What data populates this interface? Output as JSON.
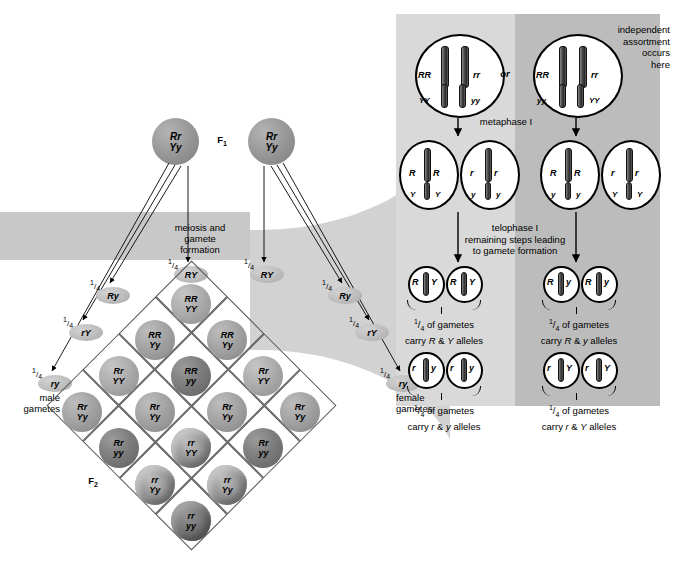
{
  "figure": {
    "generation_f1": "F<sub>1</sub>",
    "generation_f2": "F<sub>2</sub>"
  },
  "labels": {
    "f1": "F1",
    "f1_sub": "1",
    "f2": "F2",
    "f2_sub": "2",
    "meiosis_line1": "meiosis and",
    "meiosis_line2": "gamete",
    "meiosis_line3": "formation",
    "male_gametes_line1": "male",
    "male_gametes_line2": "gametes",
    "female_gametes_line1": "female",
    "female_gametes_line2": "gametes",
    "or": "or",
    "independent_1": "independent",
    "independent_2": "assortment",
    "independent_3": "occurs",
    "independent_4": "here",
    "metaphase": "metaphase I",
    "telophase_1": "telophase I",
    "telophase_2": "remaining steps leading",
    "telophase_3": "to gamete formation",
    "fraction_numerator": "1",
    "fraction_denominator": "4"
  },
  "parents": [
    {
      "id": "f1-parent-left",
      "genotype_top": "Rr",
      "genotype_bottom": "Yy"
    },
    {
      "id": "f1-parent-right",
      "genotype_top": "Rr",
      "genotype_bottom": "Yy"
    }
  ],
  "male_gametes": [
    {
      "label": "RY",
      "fraction": "1/4"
    },
    {
      "label": "Ry",
      "fraction": "1/4"
    },
    {
      "label": "rY",
      "fraction": "1/4"
    },
    {
      "label": "ry",
      "fraction": "1/4"
    }
  ],
  "female_gametes": [
    {
      "label": "RY",
      "fraction": "1/4"
    },
    {
      "label": "Ry",
      "fraction": "1/4"
    },
    {
      "label": "rY",
      "fraction": "1/4"
    },
    {
      "label": "ry",
      "fraction": "1/4"
    }
  ],
  "punnett": {
    "rows": 4,
    "cols": 4,
    "male_axis": [
      "RY",
      "Ry",
      "rY",
      "ry"
    ],
    "female_axis": [
      "RY",
      "Ry",
      "rY",
      "ry"
    ],
    "cells": [
      {
        "r": 0,
        "c": 0,
        "top": "RR",
        "bottom": "YY",
        "phenotype": "round-yellow",
        "shade": "mid"
      },
      {
        "r": 0,
        "c": 1,
        "top": "RR",
        "bottom": "Yy",
        "phenotype": "round-yellow",
        "shade": "mid"
      },
      {
        "r": 0,
        "c": 2,
        "top": "Rr",
        "bottom": "YY",
        "phenotype": "round-yellow",
        "shade": "mid"
      },
      {
        "r": 0,
        "c": 3,
        "top": "Rr",
        "bottom": "Yy",
        "phenotype": "round-yellow",
        "shade": "mid"
      },
      {
        "r": 1,
        "c": 0,
        "top": "RR",
        "bottom": "Yy",
        "phenotype": "round-yellow",
        "shade": "mid"
      },
      {
        "r": 1,
        "c": 1,
        "top": "RR",
        "bottom": "yy",
        "phenotype": "round-green",
        "shade": "dark"
      },
      {
        "r": 1,
        "c": 2,
        "top": "Rr",
        "bottom": "Yy",
        "phenotype": "round-yellow",
        "shade": "mid"
      },
      {
        "r": 1,
        "c": 3,
        "top": "Rr",
        "bottom": "yy",
        "phenotype": "round-green",
        "shade": "dark"
      },
      {
        "r": 2,
        "c": 0,
        "top": "Rr",
        "bottom": "YY",
        "phenotype": "round-yellow",
        "shade": "mid"
      },
      {
        "r": 2,
        "c": 1,
        "top": "Rr",
        "bottom": "Yy",
        "phenotype": "round-yellow",
        "shade": "mid"
      },
      {
        "r": 2,
        "c": 2,
        "top": "rr",
        "bottom": "YY",
        "phenotype": "wrinkled-yellow",
        "shade": "wrinkled"
      },
      {
        "r": 2,
        "c": 3,
        "top": "rr",
        "bottom": "Yy",
        "phenotype": "wrinkled-yellow",
        "shade": "wrinkled"
      },
      {
        "r": 3,
        "c": 0,
        "top": "Rr",
        "bottom": "Yy",
        "phenotype": "round-yellow",
        "shade": "mid"
      },
      {
        "r": 3,
        "c": 1,
        "top": "Rr",
        "bottom": "yy",
        "phenotype": "round-green",
        "shade": "dark"
      },
      {
        "r": 3,
        "c": 2,
        "top": "rr",
        "bottom": "Yy",
        "phenotype": "wrinkled-yellow",
        "shade": "wrinkled"
      },
      {
        "r": 3,
        "c": 3,
        "top": "rr",
        "bottom": "yy",
        "phenotype": "wrinkled-green",
        "shade": "wrinkled-dark"
      }
    ]
  },
  "meiosis": {
    "metaphase_cells": [
      {
        "id": "metaphase-left",
        "left_allele": "RR",
        "right_allele": "rr",
        "lower_left": "YY",
        "lower_right": "yy"
      },
      {
        "id": "metaphase-right",
        "left_allele": "RR",
        "right_allele": "rr",
        "lower_left": "yy",
        "lower_right": "YY"
      }
    ],
    "telophase_cells": [
      {
        "id": "telophase-1",
        "top_left": "R",
        "top_right": "R",
        "bottom_left": "Y",
        "bottom_right": "Y"
      },
      {
        "id": "telophase-2",
        "top_left": "r",
        "top_right": "r",
        "bottom_left": "y",
        "bottom_right": "y"
      },
      {
        "id": "telophase-3",
        "top_left": "R",
        "top_right": "R",
        "bottom_left": "y",
        "bottom_right": "y"
      },
      {
        "id": "telophase-4",
        "top_left": "r",
        "top_right": "r",
        "bottom_left": "Y",
        "bottom_right": "Y"
      }
    ],
    "gamete_groups": [
      {
        "id": "gametes-RY",
        "cells": [
          {
            "left": "R",
            "right": "Y"
          },
          {
            "left": "R",
            "right": "Y"
          }
        ],
        "caption_1": "of gametes",
        "caption_2": "carry R & Y alleles",
        "fraction": "1/4",
        "allele_a": "R",
        "allele_b": "Y"
      },
      {
        "id": "gametes-Ry",
        "cells": [
          {
            "left": "R",
            "right": "y"
          },
          {
            "left": "R",
            "right": "y"
          }
        ],
        "caption_1": "of gametes",
        "caption_2": "carry R & y alleles",
        "fraction": "1/4",
        "allele_a": "R",
        "allele_b": "y"
      },
      {
        "id": "gametes-ry",
        "cells": [
          {
            "left": "r",
            "right": "y"
          },
          {
            "left": "r",
            "right": "y"
          }
        ],
        "caption_1": "of gametes",
        "caption_2": "carry r & y alleles",
        "fraction": "1/4",
        "allele_a": "r",
        "allele_b": "y"
      },
      {
        "id": "gametes-rY",
        "cells": [
          {
            "left": "r",
            "right": "Y"
          },
          {
            "left": "r",
            "right": "Y"
          }
        ],
        "caption_1": "of gametes",
        "caption_2": "carry r & Y alleles",
        "fraction": "1/4",
        "allele_a": "r",
        "allele_b": "Y"
      }
    ],
    "caption_of_gametes": "of gametes",
    "caption_carry": "carry",
    "caption_amp": "&",
    "caption_alleles": "alleles"
  },
  "colors": {
    "band": "#c8c8c8",
    "funnel": "#d2d2d2",
    "panel_left": "#d9d9d9",
    "panel_right": "#bcbcbc",
    "line": "#555555",
    "ink": "#000000"
  }
}
